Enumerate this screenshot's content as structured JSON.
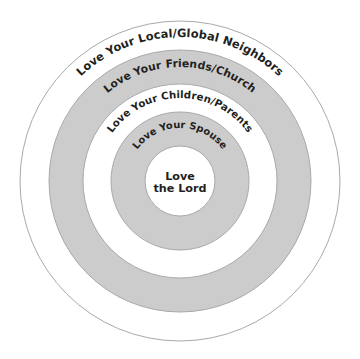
{
  "diagram": {
    "name": "Circles of Love",
    "type": "concentric-circles",
    "canvas": {
      "width": 360,
      "height": 359,
      "background": "#ffffff"
    },
    "center": {
      "x": 180,
      "y": 181
    },
    "colors": {
      "gray_fill": "#cccccc",
      "white_fill": "#ffffff",
      "stroke": "#a7a9ac",
      "text": "#231f20"
    },
    "rings": [
      {
        "index": 0,
        "label": "Love Your Local/Global Neighbors",
        "fill": "#ffffff",
        "outer_radius": 160,
        "inner_radius": 131,
        "label_radius": 144,
        "font_size": 11.4,
        "letter_spacing": 0.1
      },
      {
        "index": 1,
        "label": "Love Your Friends/Church",
        "fill": "#cccccc",
        "outer_radius": 131,
        "inner_radius": 97,
        "label_radius": 114,
        "font_size": 10.8,
        "letter_spacing": 0.1
      },
      {
        "index": 2,
        "label": "Love Your Children/Parents",
        "fill": "#ffffff",
        "outer_radius": 97,
        "inner_radius": 69,
        "label_radius": 83,
        "font_size": 10.2,
        "letter_spacing": 0.1
      },
      {
        "index": 3,
        "label": "Love Your Spouse",
        "fill": "#cccccc",
        "outer_radius": 69,
        "inner_radius": 35,
        "label_radius": 53,
        "font_size": 9.8,
        "letter_spacing": 0.1
      },
      {
        "index": 4,
        "label": "Love the Lord",
        "fill": "#ffffff",
        "outer_radius": 35,
        "inner_radius": 0,
        "label_radius": 0,
        "font_size": 11.2,
        "letter_spacing": 0
      }
    ],
    "center_label": {
      "line1": "Love",
      "line2": "the Lord"
    }
  }
}
